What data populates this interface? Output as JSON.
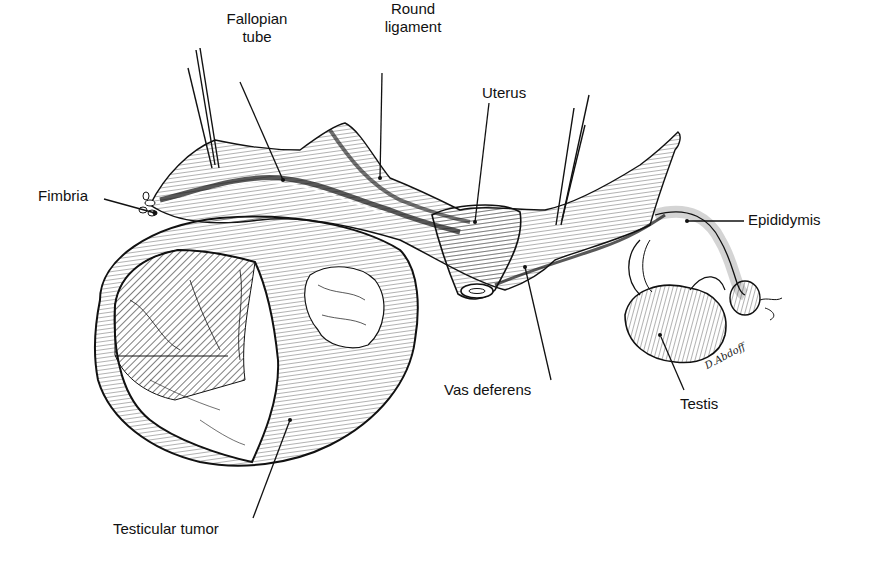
{
  "figure": {
    "labels": {
      "fallopian_tube": "Fallopian\ntube",
      "fallopian_tube_line1": "Fallopian",
      "fallopian_tube_line2": "tube",
      "round_ligament_line1": "Round",
      "round_ligament_line2": "ligament",
      "uterus": "Uterus",
      "fimbria": "Fimbria",
      "epididymis": "Epididymis",
      "vas_deferens": "Vas deferens",
      "testis": "Testis",
      "testicular_tumor": "Testicular tumor"
    },
    "signature": "D.Abdoff",
    "colors": {
      "ink": "#111111",
      "background": "#ffffff"
    }
  }
}
